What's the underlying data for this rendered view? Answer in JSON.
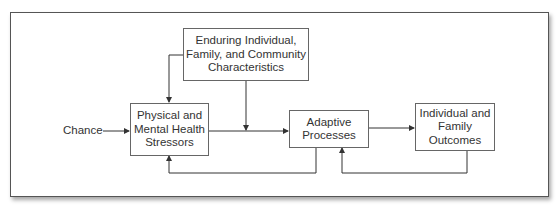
{
  "diagram": {
    "type": "flowchart",
    "input_label": "Chance",
    "nodes": {
      "enduring": "Enduring Individual, Family, and Community Characteristics",
      "stressors": "Physical and Mental Health Stressors",
      "adaptive": "Adaptive Processes",
      "outcomes": "Individual and Family Outcomes"
    },
    "node_lines": {
      "enduring": [
        "Enduring Individual,",
        "Family, and Community",
        "Characteristics"
      ],
      "stressors": [
        "Physical and",
        "Mental Health",
        "Stressors"
      ],
      "adaptive": [
        "Adaptive",
        "Processes"
      ],
      "outcomes": [
        "Individual and",
        "Family",
        "Outcomes"
      ]
    },
    "edges": [
      {
        "from": "Chance",
        "to": "stressors"
      },
      {
        "from": "enduring",
        "to": "stressors"
      },
      {
        "from": "enduring",
        "to": "stressors->adaptive link"
      },
      {
        "from": "stressors",
        "to": "adaptive"
      },
      {
        "from": "adaptive",
        "to": "outcomes"
      },
      {
        "from": "adaptive",
        "to": "stressors",
        "kind": "feedback"
      },
      {
        "from": "outcomes",
        "to": "adaptive",
        "kind": "feedback"
      }
    ],
    "colors": {
      "line": "#333333",
      "border": "#666666",
      "text": "#333333"
    }
  }
}
